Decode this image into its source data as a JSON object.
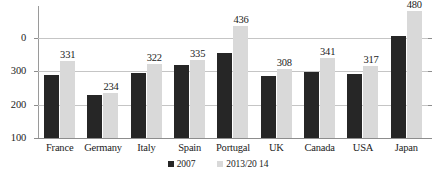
{
  "chart_data": {
    "type": "bar",
    "title": "",
    "xlabel": "",
    "ylabel": "",
    "categories": [
      "France",
      "Germany",
      "Italy",
      "Spain",
      "Portugal",
      "UK",
      "Canada",
      "USA",
      "Japan"
    ],
    "series": [
      {
        "name": "2007",
        "color": "#262626",
        "values": [
          288,
          228,
          295,
          318,
          355,
          286,
          297,
          291,
          405
        ],
        "labels_shown": false
      },
      {
        "name": "2013/20 14",
        "color": "#d9d9d9",
        "values": [
          331,
          234,
          322,
          335,
          436,
          308,
          341,
          317,
          480
        ],
        "labels_shown": true,
        "value_labels": [
          "331",
          "234",
          "322",
          "335",
          "436",
          "308",
          "341",
          "317",
          "480"
        ]
      }
    ],
    "ylim": [
      100,
      400
    ],
    "ytick_labels": [
      "0",
      "300",
      "200",
      "100"
    ],
    "ytick_values": [
      400,
      300,
      200,
      100
    ],
    "grid": true,
    "legend_position": "bottom"
  },
  "legend": {
    "items": [
      {
        "label": "2007",
        "swatch": "dark-swatch"
      },
      {
        "label": "2013/20 14",
        "swatch": "light-swatch"
      }
    ]
  },
  "title_remnant": ""
}
